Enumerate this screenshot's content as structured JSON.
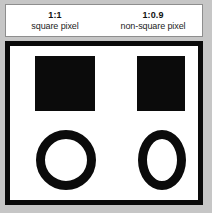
{
  "figure": {
    "background_color": "#c6c6c6",
    "panel_background": "#ffffff",
    "frame_color": "#0a0a0a",
    "shape_color": "#0b0b0b"
  },
  "legend": {
    "columns": [
      {
        "ratio": "1:1",
        "label": "square pixel"
      },
      {
        "ratio": "1:0.9",
        "label": "non-square pixel"
      }
    ]
  },
  "panel": {
    "columns": [
      {
        "name": "square-pixel-column",
        "ratio": "1:1",
        "shapes": [
          {
            "kind": "square",
            "name": "square-shape",
            "width": 60,
            "height": 55,
            "color": "#0b0b0b"
          },
          {
            "kind": "circle",
            "name": "circle-shape",
            "width": 60,
            "height": 60,
            "stroke": 9,
            "color": "#0b0b0b"
          }
        ]
      },
      {
        "name": "non-square-pixel-column",
        "ratio": "1:0.9",
        "shapes": [
          {
            "kind": "rectangle",
            "name": "rectangle-shape",
            "width": 48,
            "height": 55,
            "color": "#0b0b0b"
          },
          {
            "kind": "ellipse",
            "name": "ellipse-shape",
            "width": 48,
            "height": 60,
            "stroke": 9,
            "color": "#0b0b0b"
          }
        ]
      }
    ]
  }
}
